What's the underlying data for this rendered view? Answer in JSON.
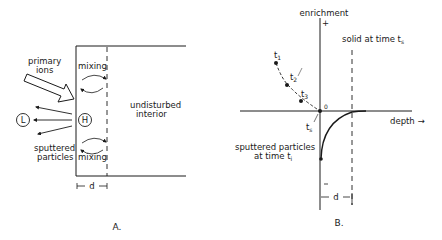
{
  "panel_a": {
    "caption": "A.",
    "labels": {
      "primary_ions_1": "primary",
      "primary_ions_2": "ions",
      "mixing_top": "mixing",
      "mixing_bottom": "mixing",
      "undisturbed_1": "undisturbed",
      "undisturbed_2": "interior",
      "sputtered_1": "sputtered",
      "sputtered_2": "particles",
      "light_species": "L",
      "heavy_species": "H",
      "depth_d": "d"
    }
  },
  "panel_b": {
    "caption": "B.",
    "labels": {
      "y_axis": "enrichment",
      "plus": "+",
      "x_axis": "depth →",
      "origin": "0",
      "solid_1": "solid at time t",
      "solid_sub": "s",
      "t1": "t",
      "t1_sub": "1",
      "t2": "t",
      "t2_sub": "2",
      "t3": "t",
      "t3_sub": "3",
      "ts": "t",
      "ts_sub": "s",
      "sputtered_1": "sputtered particles",
      "sputtered_2": "at time t",
      "sputtered_sub": "i",
      "depth_d": "d"
    }
  },
  "colors": {
    "ink": "#1a1a1a",
    "background": "#ffffff"
  }
}
